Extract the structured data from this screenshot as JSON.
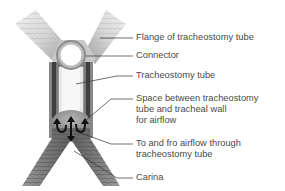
{
  "diagram": {
    "labels": [
      {
        "id": "flange",
        "lines": [
          "Flange of tracheostomy tube"
        ]
      },
      {
        "id": "connector",
        "lines": [
          "Connector"
        ]
      },
      {
        "id": "tube",
        "lines": [
          "Tracheostomy tube"
        ]
      },
      {
        "id": "space",
        "lines": [
          "Space between tracheostomy",
          "tube and tracheal wall",
          "for airflow"
        ]
      },
      {
        "id": "airflow",
        "lines": [
          "To and fro airflow through",
          "tracheostomy tube"
        ]
      },
      {
        "id": "carina",
        "lines": [
          "Carina"
        ]
      }
    ],
    "colors": {
      "label_text": "#4a4a4a",
      "leader_line": "#333333",
      "flange_light": "#e8e8e8",
      "flange_dark": "#a0a0a0",
      "trachea_dark": "#555555",
      "tube_interior": "#f4f4f4",
      "arrow": "#111111"
    }
  }
}
